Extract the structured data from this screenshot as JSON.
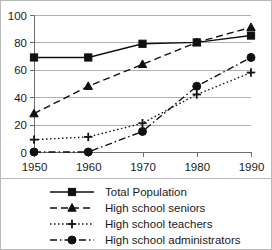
{
  "chart_data": {
    "type": "line",
    "title": "",
    "xlabel": "",
    "ylabel": "",
    "categories": [
      "1950",
      "1960",
      "1970",
      "1980",
      "1990"
    ],
    "x": [
      1950,
      1960,
      1970,
      1980,
      1990
    ],
    "ylim": [
      0,
      100
    ],
    "yticks": [
      0,
      20,
      40,
      60,
      80,
      100
    ],
    "grid": "horizontal",
    "legend_position": "bottom",
    "series": [
      {
        "name": "Total Population",
        "values": [
          69,
          69,
          79,
          80,
          85
        ],
        "line_style": "solid",
        "marker": "square",
        "color": "#111111"
      },
      {
        "name": "High school seniors",
        "values": [
          28,
          48,
          64,
          80,
          91
        ],
        "line_style": "dashed",
        "marker": "triangle",
        "color": "#111111"
      },
      {
        "name": "High school teachers",
        "values": [
          9,
          11,
          21,
          42,
          58
        ],
        "line_style": "dotted",
        "marker": "plus",
        "color": "#111111"
      },
      {
        "name": "High school administrators",
        "values": [
          0,
          0,
          15,
          48,
          69
        ],
        "line_style": "dash-dot",
        "marker": "circle",
        "color": "#111111"
      }
    ]
  },
  "axis": {
    "ytick_labels": [
      "100",
      "80",
      "60",
      "40",
      "20",
      "0"
    ],
    "xtick_labels": [
      "1950",
      "1960",
      "1970",
      "1980",
      "1990"
    ]
  },
  "legend": {
    "items": [
      {
        "label": "Total Population"
      },
      {
        "label": "High school seniors"
      },
      {
        "label": "High school teachers"
      },
      {
        "label": "High school administrators"
      }
    ]
  }
}
